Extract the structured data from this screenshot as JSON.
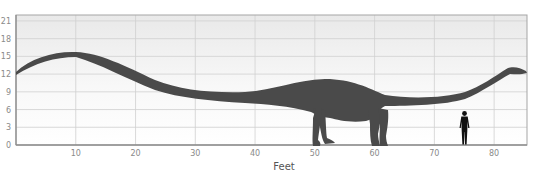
{
  "chart_data": {
    "type": "scatter",
    "title": "",
    "subtitle": "",
    "xlabel": "Feet",
    "ylabel": "",
    "xlim": [
      0,
      85.5
    ],
    "ylim": [
      0,
      22
    ],
    "x_ticks": [
      10,
      20,
      30,
      40,
      50,
      60,
      70,
      80
    ],
    "y_ticks": [
      0,
      3,
      6,
      9,
      12,
      15,
      18,
      21
    ],
    "grid": true,
    "legend": null,
    "annotations": [],
    "series": [
      {
        "name": "Sauropod dinosaur silhouette",
        "kind": "silhouette",
        "color": "#4a4a4a",
        "length_ft": 85,
        "max_height_ft": 15.7,
        "tail_tip": {
          "x": 0,
          "y": 12.4
        },
        "tail_peak": {
          "x": 10,
          "y": 15.7
        },
        "back_peak": {
          "x": 53,
          "y": 12.8
        },
        "head": {
          "x": 85,
          "y": 12.5
        },
        "front_legs_x": [
          50,
          52
        ],
        "hind_legs_x": [
          59,
          61
        ]
      },
      {
        "name": "Human for scale",
        "kind": "silhouette",
        "color": "#111111",
        "x": 75,
        "height_ft": 6
      }
    ]
  },
  "colors": {
    "background": "#ffffff",
    "plot_bg_top": "#ececec",
    "plot_bg_bottom": "#ffffff",
    "grid": "#cfcfcf",
    "axis": "#9a9a9a",
    "dinosaur": "#4a4a4a",
    "human": "#111111"
  }
}
